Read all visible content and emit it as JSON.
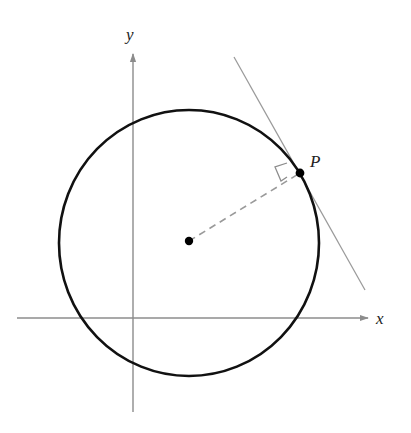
{
  "figure": {
    "labels": {
      "x_axis": "x",
      "y_axis": "y",
      "point": "P"
    },
    "colors": {
      "axes": "#8c8c8c",
      "circle": "#111111",
      "tangent": "#9a9a9a",
      "radius": "#9a9a9a",
      "points": "#000000"
    },
    "geometry": {
      "center": [
        189,
        243
      ],
      "radius_px": 131,
      "point_p": [
        300,
        173
      ],
      "tangent_from": [
        234,
        57
      ],
      "tangent_to": [
        365,
        290
      ]
    }
  }
}
